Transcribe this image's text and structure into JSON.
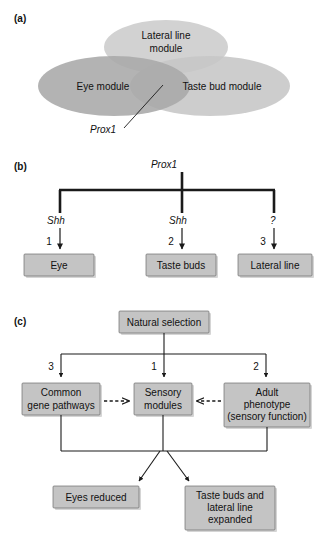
{
  "figure": {
    "panels": [
      {
        "id": "a",
        "label": "(a)"
      },
      {
        "id": "b",
        "label": "(b)"
      },
      {
        "id": "c",
        "label": "(c)"
      }
    ]
  },
  "panel_a": {
    "ellipses": [
      {
        "name": "lateral-line-module",
        "line1": "Lateral line",
        "line2": "module",
        "fill": "#d2d2d2"
      },
      {
        "name": "eye-module",
        "line1": "Eye module",
        "line2": "",
        "fill": "#a8a8a8"
      },
      {
        "name": "taste-bud-module",
        "line1": "Taste bud module",
        "line2": "",
        "fill": "#c6c6c6"
      }
    ],
    "annotation": {
      "label": "Prox1"
    }
  },
  "panel_b": {
    "source": "Prox1",
    "branches": [
      {
        "gene": "Shh",
        "number": "1",
        "target": "Eye"
      },
      {
        "gene": "Shh",
        "number": "2",
        "target": "Taste buds"
      },
      {
        "gene": "?",
        "number": "3",
        "target": "Lateral line"
      }
    ]
  },
  "panel_c": {
    "source": "Natural selection",
    "branches": [
      {
        "number": "3",
        "target_line1": "Common",
        "target_line2": "gene pathways",
        "target_line3": ""
      },
      {
        "number": "1",
        "target_line1": "Sensory",
        "target_line2": "modules",
        "target_line3": ""
      },
      {
        "number": "2",
        "target_line1": "Adult",
        "target_line2": "phenotype",
        "target_line3": "(sensory function)"
      }
    ],
    "outcomes": [
      {
        "line1": "Eyes reduced",
        "line2": "",
        "line3": ""
      },
      {
        "line1": "Taste buds and",
        "line2": "lateral line",
        "line3": "expanded"
      }
    ]
  },
  "colors": {
    "box_fill": "#c4c4c4",
    "box_stroke": "#6e6e6e",
    "line": "#1a1a1a",
    "background": "#ffffff"
  }
}
